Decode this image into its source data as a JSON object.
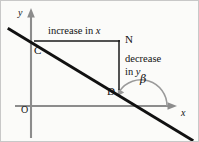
{
  "figure": {
    "kind": "coordinate-geometry-diagram",
    "width": 199,
    "height": 142
  },
  "axes": {
    "y_label": "y",
    "x_label": "x",
    "origin_label": "O",
    "color": "#8c8c8c"
  },
  "points": {
    "c": "C",
    "n": "N",
    "d": "D"
  },
  "annotations": {
    "increase_in_x": "increase in x",
    "increase_in_x_text": "increase in ",
    "increase_in_x_var": "x",
    "decrease_line1": "decrease",
    "decrease_line2_text": "in ",
    "decrease_line2_var": "y",
    "angle": "β"
  },
  "colors": {
    "line": "#111111",
    "construction": "#1a1a1a",
    "axis": "#8c8c8c",
    "arc": "#9a9a9a",
    "background": "#fbfbf9",
    "border": "#c8c8c8",
    "text": "#111111"
  },
  "geometry": {
    "sloped_line": {
      "x1": 8,
      "y1": 28,
      "x2": 191,
      "y2": 139
    },
    "y_axis": {
      "x": 30,
      "y_top": 10,
      "y_bottom": 137
    },
    "x_axis": {
      "y": 105,
      "x_left": 14,
      "x_right": 176
    },
    "horizontal_leg": {
      "x1": 33,
      "y1": 40,
      "x2": 118,
      "y2": 40
    },
    "vertical_leg": {
      "x": 118,
      "y1": 40,
      "y2": 88
    },
    "x_intercept": {
      "x": 140,
      "y": 110
    },
    "angle_arc_radius": 26
  }
}
